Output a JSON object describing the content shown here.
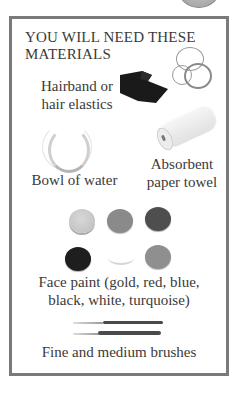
{
  "panel": {
    "title": "YOU WILL NEED THESE MATERIALS",
    "border_color": "#7a7a7a"
  },
  "items": [
    {
      "label": "Hairband or hair elastics",
      "icon": "hairband-icon"
    },
    {
      "label": "Bowl of water",
      "icon": "bowl-icon"
    },
    {
      "label": "Absorbent paper towel",
      "icon": "paper-towel-icon"
    },
    {
      "label": "Face paint (gold, red, blue, black, white, turquoise)",
      "icon": "face-paint-icon"
    },
    {
      "label": "Fine and medium brushes",
      "icon": "brushes-icon"
    }
  ],
  "labels": {
    "hairband_line1": "Hairband or",
    "hairband_line2": "hair elastics",
    "bowl": "Bowl of water",
    "towel_line1": "Absorbent",
    "towel_line2": "paper towel",
    "paint_line1": "Face paint (gold, red, blue,",
    "paint_line2": "black, white, turquoise)",
    "brushes": "Fine and medium brushes"
  },
  "paints": [
    {
      "name": "gold",
      "color": "#c9c9c9"
    },
    {
      "name": "red",
      "color": "#8a8a8a"
    },
    {
      "name": "blue",
      "color": "#4e4e4e"
    },
    {
      "name": "black",
      "color": "#1e1e1e"
    },
    {
      "name": "white",
      "color": "#ffffff"
    },
    {
      "name": "turquoise",
      "color": "#8f8f8f"
    }
  ]
}
